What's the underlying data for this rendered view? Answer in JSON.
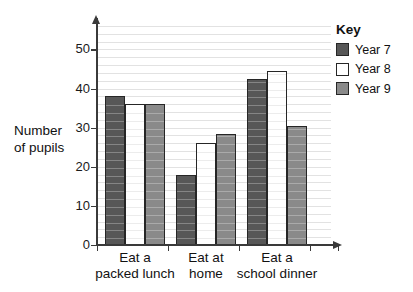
{
  "chart_data": {
    "type": "bar",
    "title": "",
    "xlabel": "",
    "ylabel": "Number of pupils",
    "ylim": [
      0,
      57
    ],
    "yticks": [
      0,
      10,
      20,
      30,
      40,
      50
    ],
    "grid": true,
    "grid_step": 2,
    "legend_position": "right",
    "legend_title": "Key",
    "categories": [
      "Eat a packed lunch",
      "Eat at home",
      "Eat a school dinner"
    ],
    "series": [
      {
        "name": "Year 7",
        "color": "#575757",
        "values": [
          38,
          18,
          42.5
        ]
      },
      {
        "name": "Year 8",
        "color": "#ffffff",
        "values": [
          36,
          26,
          44.5
        ]
      },
      {
        "name": "Year 9",
        "color": "#8a8a8a",
        "values": [
          36,
          28.5,
          30.5
        ]
      }
    ]
  },
  "axis": {
    "y_title_line1": "Number",
    "y_title_line2": "of pupils",
    "tick_labels": [
      "50",
      "40",
      "30",
      "20",
      "10",
      "0"
    ]
  },
  "category_labels": [
    {
      "line1": "Eat a",
      "line2": "packed lunch"
    },
    {
      "line1": "Eat at",
      "line2": "home"
    },
    {
      "line1": "Eat a",
      "line2": "school dinner"
    }
  ],
  "legend": {
    "title": "Key",
    "items": [
      {
        "label": "Year 7",
        "color": "#575757"
      },
      {
        "label": "Year 8",
        "color": "#ffffff"
      },
      {
        "label": "Year 9",
        "color": "#8a8a8a"
      }
    ]
  }
}
